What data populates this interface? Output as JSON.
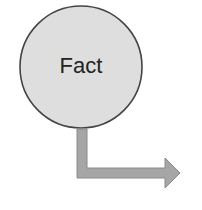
{
  "diagram": {
    "node": {
      "label": "Fact",
      "shape": "circle",
      "fill": "#dedede",
      "stroke": "#444444"
    },
    "connector": {
      "type": "elbow-arrow",
      "direction": "down-then-right",
      "fill": "#a6a6a6",
      "stroke": "#8a8a8a"
    }
  }
}
